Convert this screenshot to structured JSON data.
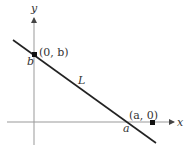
{
  "diagram": {
    "axes": {
      "x_label": "x",
      "y_label": "y"
    },
    "line": {
      "label": "L"
    },
    "points": [
      {
        "name": "y-intercept",
        "label": "(0, b)",
        "axis_label": "b"
      },
      {
        "name": "x-intercept",
        "label": "(a, 0)",
        "axis_label": "a"
      }
    ],
    "colors": {
      "axis": "#888888",
      "line": "#222222",
      "text": "#333333"
    }
  }
}
